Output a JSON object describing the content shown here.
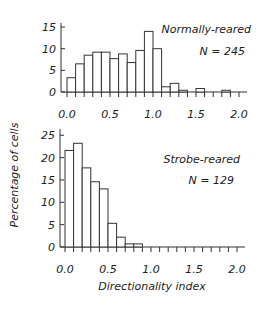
{
  "figure": {
    "ylabel": "Percentage of cells",
    "xlabel": "Directionality index"
  },
  "chart_data": [
    {
      "type": "bar",
      "title": "Normally-reared",
      "annotation": "N = 245",
      "xlabel": "Directionality index",
      "ylabel": "Percentage of cells",
      "bin_width": 0.1,
      "bin_starts": [
        0.0,
        0.1,
        0.2,
        0.3,
        0.4,
        0.5,
        0.6,
        0.7,
        0.8,
        0.9,
        1.0,
        1.1,
        1.2,
        1.3,
        1.4,
        1.5,
        1.6,
        1.7,
        1.8,
        1.9
      ],
      "values": [
        3.3,
        6.5,
        8.5,
        9.2,
        9.2,
        7.7,
        8.8,
        6.8,
        9.6,
        14.0,
        10.0,
        1.2,
        2.0,
        0.4,
        0.0,
        0.8,
        0.0,
        0.0,
        0.4,
        0.0
      ],
      "xticks": [
        "0.0",
        "0.5",
        "1.0",
        "1.5",
        "2.0"
      ],
      "yticks": [
        "0",
        "5",
        "10",
        "15"
      ],
      "xlim": [
        0,
        2.1
      ],
      "ylim": [
        0,
        16
      ],
      "grid": false
    },
    {
      "type": "bar",
      "title": "Strobe-reared",
      "annotation": "N = 129",
      "xlabel": "Directionality index",
      "ylabel": "Percentage of cells",
      "bin_width": 0.1,
      "bin_starts": [
        0.0,
        0.1,
        0.2,
        0.3,
        0.4,
        0.5,
        0.6,
        0.7,
        0.8,
        0.9,
        1.0,
        1.1,
        1.2,
        1.3,
        1.4,
        1.5,
        1.6,
        1.7,
        1.8,
        1.9
      ],
      "values": [
        21.6,
        23.2,
        17.7,
        14.6,
        13.0,
        5.3,
        2.2,
        0.7,
        0.7,
        0.0,
        0.0,
        0.0,
        0.0,
        0.0,
        0.0,
        0.0,
        0.0,
        0.0,
        0.0,
        0.0
      ],
      "xticks": [
        "0.0",
        "0.5",
        "1.0",
        "1.5",
        "2.0"
      ],
      "yticks": [
        "0",
        "5",
        "10",
        "15",
        "20",
        "25"
      ],
      "xlim": [
        0,
        2.1
      ],
      "ylim": [
        0,
        26
      ],
      "grid": false
    }
  ]
}
